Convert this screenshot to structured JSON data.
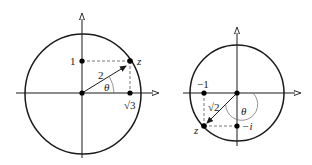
{
  "figures": [
    {
      "name": "left-diagram",
      "labels": {
        "imag_tick": "1",
        "modulus": "2",
        "angle": "θ",
        "real_tick": "√3",
        "point": "z"
      },
      "point": {
        "real": "√3",
        "imag": "1"
      },
      "modulus": "2"
    },
    {
      "name": "right-diagram",
      "labels": {
        "real_tick": "−1",
        "modulus": "√2",
        "angle": "θ",
        "imag_tick": "−i",
        "point": "z"
      },
      "point": {
        "real": "−1",
        "imag": "−1"
      },
      "modulus": "√2"
    }
  ]
}
